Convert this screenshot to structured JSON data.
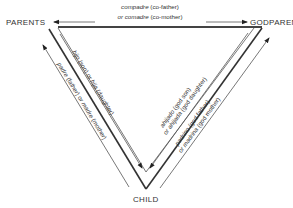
{
  "nodes": {
    "parents": "PARENTS",
    "godparents": "GODPARENTS",
    "child": "CHILD"
  },
  "edges": {
    "top": {
      "line1_term": "compadre",
      "line1_gloss": " (co-father)",
      "line2_term": "or comadre",
      "line2_gloss": " (co-mother)"
    },
    "left_inner": {
      "term1": "hijo",
      "gloss1": " (son) or ",
      "term2": "hija",
      "gloss2": " (daughter)"
    },
    "left_outer": {
      "term1": "padre",
      "gloss1": " (father) or ",
      "term2": "madre",
      "gloss2": " (mother)"
    },
    "right_inner": {
      "line1_term": "ahijado",
      "line1_gloss": " (god son)",
      "line2_term": "or ahijada",
      "line2_gloss": " (god daughter)"
    },
    "right_outer": {
      "line1_term": "padrino",
      "line1_gloss": " (god father)",
      "line2_term": "or madrina",
      "line2_gloss": " (god mother)"
    }
  }
}
